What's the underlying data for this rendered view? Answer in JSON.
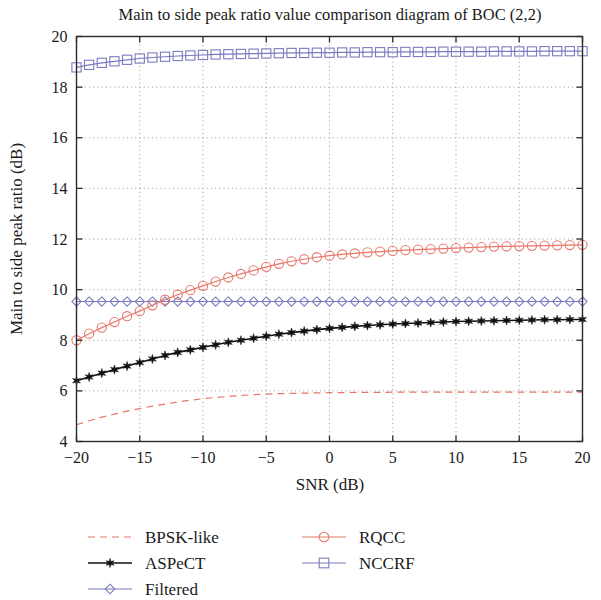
{
  "chart_data": {
    "type": "line",
    "title": "Main to side peak ratio value comparison diagram of BOC (2,2)",
    "xlabel": "SNR (dB)",
    "ylabel": "Main to side peak ratio (dB)",
    "xlim": [
      -20,
      20
    ],
    "ylim": [
      4,
      20
    ],
    "xticks": [
      -20,
      -15,
      -10,
      -5,
      0,
      5,
      10,
      15,
      20
    ],
    "xtick_labels": [
      "−20",
      "−15",
      "−10",
      "−5",
      "0",
      "5",
      "10",
      "15",
      "20"
    ],
    "yticks": [
      4,
      6,
      8,
      10,
      12,
      14,
      16,
      18,
      20
    ],
    "ytick_labels": [
      "4",
      "6",
      "8",
      "10",
      "12",
      "14",
      "16",
      "18",
      "20"
    ],
    "grid": true,
    "grid_style": "dotted",
    "legend_position": "below-plot",
    "x": [
      -20,
      -19,
      -18,
      -17,
      -16,
      -15,
      -14,
      -13,
      -12,
      -11,
      -10,
      -9,
      -8,
      -7,
      -6,
      -5,
      -4,
      -3,
      -2,
      -1,
      0,
      1,
      2,
      3,
      4,
      5,
      6,
      7,
      8,
      9,
      10,
      11,
      12,
      13,
      14,
      15,
      16,
      17,
      18,
      19,
      20
    ],
    "series": [
      {
        "name": "BPSK-like",
        "color": "#E8776A",
        "style": "dashed",
        "marker": "none",
        "values": [
          4.66,
          4.82,
          4.96,
          5.08,
          5.2,
          5.3,
          5.4,
          5.48,
          5.56,
          5.63,
          5.69,
          5.74,
          5.78,
          5.82,
          5.85,
          5.87,
          5.89,
          5.9,
          5.91,
          5.92,
          5.93,
          5.93,
          5.94,
          5.94,
          5.94,
          5.95,
          5.95,
          5.95,
          5.95,
          5.95,
          5.95,
          5.95,
          5.95,
          5.95,
          5.95,
          5.95,
          5.95,
          5.95,
          5.95,
          5.95,
          5.95
        ]
      },
      {
        "name": "ASPeCT",
        "color": "#111111",
        "style": "solid",
        "marker": "star",
        "values": [
          6.4,
          6.55,
          6.7,
          6.84,
          6.98,
          7.12,
          7.26,
          7.4,
          7.52,
          7.62,
          7.72,
          7.82,
          7.92,
          8.0,
          8.08,
          8.16,
          8.24,
          8.3,
          8.36,
          8.42,
          8.47,
          8.51,
          8.55,
          8.58,
          8.61,
          8.64,
          8.66,
          8.68,
          8.7,
          8.72,
          8.74,
          8.75,
          8.76,
          8.77,
          8.78,
          8.79,
          8.8,
          8.81,
          8.81,
          8.82,
          8.82
        ]
      },
      {
        "name": "Filtered",
        "color": "#7B7BC0",
        "style": "solid",
        "marker": "diamond",
        "values": [
          9.53,
          9.53,
          9.53,
          9.53,
          9.53,
          9.53,
          9.53,
          9.53,
          9.53,
          9.53,
          9.53,
          9.53,
          9.53,
          9.53,
          9.53,
          9.53,
          9.53,
          9.53,
          9.53,
          9.53,
          9.53,
          9.53,
          9.53,
          9.53,
          9.53,
          9.53,
          9.53,
          9.53,
          9.53,
          9.53,
          9.53,
          9.53,
          9.53,
          9.53,
          9.53,
          9.53,
          9.53,
          9.53,
          9.53,
          9.53,
          9.53
        ]
      },
      {
        "name": "RQCC",
        "color": "#E8776A",
        "style": "solid",
        "marker": "circle",
        "values": [
          8.0,
          8.26,
          8.5,
          8.72,
          8.95,
          9.15,
          9.38,
          9.6,
          9.8,
          9.98,
          10.15,
          10.32,
          10.48,
          10.62,
          10.76,
          10.9,
          11.02,
          11.12,
          11.2,
          11.28,
          11.34,
          11.39,
          11.43,
          11.47,
          11.5,
          11.53,
          11.56,
          11.58,
          11.6,
          11.62,
          11.64,
          11.66,
          11.68,
          11.7,
          11.71,
          11.72,
          11.73,
          11.74,
          11.75,
          11.76,
          11.77
        ]
      },
      {
        "name": "NCCRF",
        "color": "#7B7BC0",
        "style": "solid",
        "marker": "square",
        "values": [
          18.78,
          18.88,
          18.96,
          19.02,
          19.08,
          19.13,
          19.17,
          19.2,
          19.23,
          19.25,
          19.27,
          19.29,
          19.3,
          19.31,
          19.32,
          19.33,
          19.34,
          19.35,
          19.35,
          19.36,
          19.36,
          19.37,
          19.37,
          19.38,
          19.38,
          19.38,
          19.39,
          19.39,
          19.39,
          19.4,
          19.4,
          19.4,
          19.4,
          19.41,
          19.41,
          19.41,
          19.41,
          19.42,
          19.42,
          19.42,
          19.42
        ]
      }
    ],
    "legend": [
      {
        "label": "BPSK-like",
        "color": "#E8776A",
        "style": "dashed",
        "marker": "none"
      },
      {
        "label": "ASPeCT",
        "color": "#111111",
        "style": "solid",
        "marker": "star"
      },
      {
        "label": "Filtered",
        "color": "#7B7BC0",
        "style": "solid",
        "marker": "diamond"
      },
      {
        "label": "RQCC",
        "color": "#E8776A",
        "style": "solid",
        "marker": "circle"
      },
      {
        "label": "NCCRF",
        "color": "#7B7BC0",
        "style": "solid",
        "marker": "square"
      }
    ]
  }
}
